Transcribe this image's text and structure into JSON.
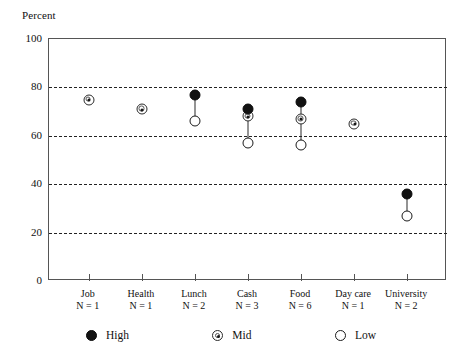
{
  "chart_data": {
    "type": "scatter",
    "title": "",
    "ylabel": "Percent",
    "xlabel": "",
    "ylim": [
      0,
      100
    ],
    "yticks": [
      0,
      20,
      40,
      60,
      80,
      100
    ],
    "grid": "horizontal-dashed-at-20-40-60-80",
    "legend_position": "bottom",
    "categories": [
      "Job",
      "Health",
      "Lunch",
      "Cash",
      "Food",
      "Day care",
      "University"
    ],
    "category_counts": [
      "N = 1",
      "N = 1",
      "N = 2",
      "N = 3",
      "N = 6",
      "N = 1",
      "N = 2"
    ],
    "series": [
      {
        "name": "High",
        "values": [
          null,
          null,
          77,
          71,
          74,
          null,
          36
        ]
      },
      {
        "name": "Mid",
        "values": [
          75,
          71,
          null,
          68,
          67,
          65,
          null
        ]
      },
      {
        "name": "Low",
        "values": [
          null,
          null,
          66,
          57,
          56,
          null,
          27
        ]
      }
    ],
    "points": [
      {
        "category": "Job",
        "n": "N = 1",
        "high": null,
        "mid": 75,
        "low": null
      },
      {
        "category": "Health",
        "n": "N = 1",
        "high": null,
        "mid": 71,
        "low": null
      },
      {
        "category": "Lunch",
        "n": "N = 2",
        "high": 77,
        "mid": null,
        "low": 66
      },
      {
        "category": "Cash",
        "n": "N = 3",
        "high": 71,
        "mid": 68,
        "low": 57
      },
      {
        "category": "Food",
        "n": "N = 6",
        "high": 74,
        "mid": 67,
        "low": 56
      },
      {
        "category": "Day care",
        "n": "N = 1",
        "high": null,
        "mid": 65,
        "low": null
      },
      {
        "category": "University",
        "n": "N = 2",
        "high": 36,
        "mid": null,
        "low": 27
      }
    ]
  },
  "axis": {
    "y_title": "Percent",
    "y_tick_labels": [
      "100",
      "80",
      "60",
      "40",
      "20",
      "0"
    ]
  },
  "legend": {
    "entries": [
      {
        "key": "high",
        "label": "High"
      },
      {
        "key": "mid",
        "label": "Mid"
      },
      {
        "key": "low",
        "label": "Low"
      }
    ]
  },
  "colors": {
    "high_marker": "#121212",
    "mid_marker": "#2b2b2b",
    "low_marker": "#1a1a1a",
    "axis": "#555555",
    "gridline": "#222222",
    "background": "#ffffff"
  }
}
